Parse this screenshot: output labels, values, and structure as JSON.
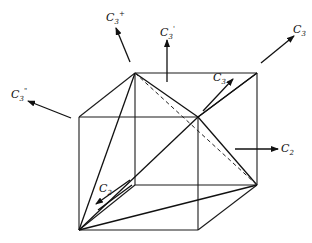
{
  "figure": {
    "stroke_color": "#111111",
    "background": "#ffffff"
  },
  "labels": {
    "c3_top_left": {
      "base": "C",
      "sub": "3",
      "sup": "+"
    },
    "c3_top_mid": {
      "base": "C",
      "sub": "3",
      "sup": "'"
    },
    "c3_top_right": {
      "base": "C",
      "sub": "3",
      "sup": ""
    },
    "c3_left": {
      "base": "C",
      "sub": "3",
      "sup": "\""
    },
    "c3_inner": {
      "base": "C",
      "sub": "3",
      "sup": ""
    },
    "c2_right": {
      "base": "C",
      "sub": "2",
      "sup": ""
    },
    "c2_inner": {
      "base": "C",
      "sub": "2",
      "sup": ""
    }
  }
}
